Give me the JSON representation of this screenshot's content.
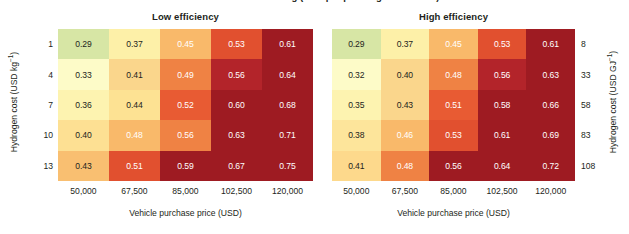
{
  "figure": {
    "clipped_top_text": "levelized cost of driving (USD per passenger-kilometre)",
    "xlabel": "Vehicle purchase price (USD)",
    "xticks": [
      "50,000",
      "67,500",
      "85,000",
      "102,500",
      "120,000"
    ],
    "left_ylabel_text": "Hydrogen cost (USD kg",
    "left_ylabel_sup": "−1",
    "left_ylabel_close": ")",
    "right_ylabel_text": "Hydrogen cost (USD GJ",
    "right_ylabel_sup": "−1",
    "right_ylabel_close": ")",
    "left_yticks": [
      "1",
      "4",
      "7",
      "10",
      "13"
    ],
    "right_yticks": [
      "8",
      "33",
      "58",
      "83",
      "108"
    ]
  },
  "panels": [
    {
      "id": "low-efficiency",
      "title": "Low efficiency"
    },
    {
      "id": "high-efficiency",
      "title": "High efficiency"
    }
  ],
  "chart_data": [
    {
      "type": "heatmap",
      "title": "Low efficiency",
      "xlabel": "Vehicle purchase price (USD)",
      "ylabel": "Hydrogen cost (USD kg−1)",
      "x": [
        50000,
        67500,
        85000,
        102500,
        120000
      ],
      "xtick_labels": [
        "50,000",
        "67,500",
        "85,000",
        "102,500",
        "120,000"
      ],
      "y": [
        1,
        4,
        7,
        10,
        13
      ],
      "ytick_labels": [
        "1",
        "4",
        "7",
        "10",
        "13"
      ],
      "values": [
        [
          0.29,
          0.37,
          0.45,
          0.53,
          0.61
        ],
        [
          0.33,
          0.41,
          0.49,
          0.56,
          0.64
        ],
        [
          0.36,
          0.44,
          0.52,
          0.6,
          0.68
        ],
        [
          0.4,
          0.48,
          0.56,
          0.63,
          0.71
        ],
        [
          0.43,
          0.51,
          0.59,
          0.67,
          0.75
        ]
      ],
      "cell_colors": [
        [
          "#d7e6a5",
          "#fdf0a8",
          "#f9b96a",
          "#e1502f",
          "#9e1b22"
        ],
        [
          "#fdfbc8",
          "#fad68c",
          "#ef8244",
          "#b3242a",
          "#9e1b22"
        ],
        [
          "#fdf3b0",
          "#fde293",
          "#e85b33",
          "#9e1b22",
          "#9e1b22"
        ],
        [
          "#fde093",
          "#f9b96a",
          "#ef8244",
          "#9e1b22",
          "#9e1b22"
        ],
        [
          "#f9bf71",
          "#e1502f",
          "#9e1b22",
          "#9e1b22",
          "#9e1b22"
        ]
      ],
      "text_colors": [
        [
          "dark",
          "dark",
          "light",
          "light",
          "light"
        ],
        [
          "dark",
          "dark",
          "light",
          "light",
          "light"
        ],
        [
          "dark",
          "dark",
          "light",
          "light",
          "light"
        ],
        [
          "dark",
          "light",
          "light",
          "light",
          "light"
        ],
        [
          "dark",
          "light",
          "light",
          "light",
          "light"
        ]
      ],
      "colorbar_low": "#d7e6a5",
      "colorbar_high": "#9e1b22",
      "grid": false
    },
    {
      "type": "heatmap",
      "title": "High efficiency",
      "xlabel": "Vehicle purchase price (USD)",
      "ylabel": "Hydrogen cost (USD GJ−1)",
      "x": [
        50000,
        67500,
        85000,
        102500,
        120000
      ],
      "xtick_labels": [
        "50,000",
        "67,500",
        "85,000",
        "102,500",
        "120,000"
      ],
      "y": [
        8,
        33,
        58,
        83,
        108
      ],
      "ytick_labels": [
        "8",
        "33",
        "58",
        "83",
        "108"
      ],
      "values": [
        [
          0.29,
          0.37,
          0.45,
          0.53,
          0.61
        ],
        [
          0.32,
          0.4,
          0.48,
          0.56,
          0.63
        ],
        [
          0.35,
          0.43,
          0.51,
          0.58,
          0.66
        ],
        [
          0.38,
          0.46,
          0.53,
          0.61,
          0.69
        ],
        [
          0.41,
          0.48,
          0.56,
          0.64,
          0.72
        ]
      ],
      "cell_colors": [
        [
          "#d7e6a5",
          "#fdf0a8",
          "#f9b96a",
          "#e1502f",
          "#9e1b22"
        ],
        [
          "#fdfbc8",
          "#fad68c",
          "#ef8244",
          "#b3242a",
          "#9e1b22"
        ],
        [
          "#fdf3b0",
          "#fad68c",
          "#e85b33",
          "#9e1b22",
          "#9e1b22"
        ],
        [
          "#fde59b",
          "#f9b96a",
          "#e1502f",
          "#9e1b22",
          "#9e1b22"
        ],
        [
          "#fdd98c",
          "#ef8244",
          "#9e1b22",
          "#9e1b22",
          "#9e1b22"
        ]
      ],
      "text_colors": [
        [
          "dark",
          "dark",
          "light",
          "light",
          "light"
        ],
        [
          "dark",
          "dark",
          "light",
          "light",
          "light"
        ],
        [
          "dark",
          "dark",
          "light",
          "light",
          "light"
        ],
        [
          "dark",
          "light",
          "light",
          "light",
          "light"
        ],
        [
          "dark",
          "light",
          "light",
          "light",
          "light"
        ]
      ],
      "colorbar_low": "#d7e6a5",
      "colorbar_high": "#9e1b22",
      "grid": false
    }
  ]
}
